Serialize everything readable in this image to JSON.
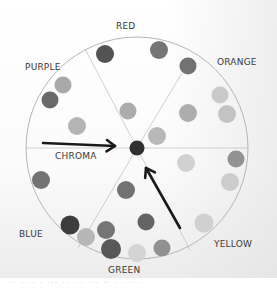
{
  "diagram": {
    "type": "color-wheel",
    "center": {
      "x": 137,
      "y": 148
    },
    "radius": 111,
    "labels": {
      "red": "RED",
      "orange": "ORANGE",
      "yellow": "YELLOW",
      "green": "GREEN",
      "blue": "BLUE",
      "purple": "PURPLE",
      "chroma": "CHROMA"
    },
    "colors": {
      "circle_stroke": "#b5b5b5",
      "divider_stroke": "#c4c4c4",
      "arrow": "#1a1a1a",
      "label_text": "#3a3a3a"
    },
    "dividers": [
      {
        "x2": 26,
        "y2": 148
      },
      {
        "x2": 248,
        "y2": 148
      },
      {
        "x2": 85,
        "y2": 49
      },
      {
        "x2": 182,
        "y2": 73
      },
      {
        "x2": 78,
        "y2": 248
      },
      {
        "x2": 190,
        "y2": 250
      }
    ],
    "dots": [
      {
        "x": 105,
        "y": 54,
        "r": 9,
        "shade": "#4a4a4a"
      },
      {
        "x": 159,
        "y": 50,
        "r": 9,
        "shade": "#6e6e6e"
      },
      {
        "x": 188,
        "y": 66,
        "r": 8.5,
        "shade": "#6a6a6a"
      },
      {
        "x": 63,
        "y": 85,
        "r": 8.5,
        "shade": "#a4a4a4"
      },
      {
        "x": 50,
        "y": 100,
        "r": 8.5,
        "shade": "#626262"
      },
      {
        "x": 128,
        "y": 111,
        "r": 8.5,
        "shade": "#a8a8a8"
      },
      {
        "x": 77,
        "y": 126,
        "r": 9,
        "shade": "#b0b0b0"
      },
      {
        "x": 220,
        "y": 95,
        "r": 8.5,
        "shade": "#c6c6c6"
      },
      {
        "x": 188,
        "y": 113,
        "r": 9,
        "shade": "#a9a9a9"
      },
      {
        "x": 227,
        "y": 114,
        "r": 9,
        "shade": "#c0c0c0"
      },
      {
        "x": 157,
        "y": 136,
        "r": 9,
        "shade": "#b4b4b4"
      },
      {
        "x": 186,
        "y": 163,
        "r": 9,
        "shade": "#cfcfcf"
      },
      {
        "x": 236,
        "y": 159,
        "r": 8.5,
        "shade": "#8c8c8c"
      },
      {
        "x": 41,
        "y": 180,
        "r": 9,
        "shade": "#6c6c6c"
      },
      {
        "x": 126,
        "y": 190,
        "r": 9,
        "shade": "#6a6a6a"
      },
      {
        "x": 230,
        "y": 182,
        "r": 9,
        "shade": "#c9c9c9"
      },
      {
        "x": 70,
        "y": 225,
        "r": 9.5,
        "shade": "#333333"
      },
      {
        "x": 146,
        "y": 222,
        "r": 8.5,
        "shade": "#5c5c5c"
      },
      {
        "x": 204,
        "y": 223,
        "r": 9.5,
        "shade": "#cdcdcd"
      },
      {
        "x": 106,
        "y": 230,
        "r": 9,
        "shade": "#6e6e6e"
      },
      {
        "x": 86,
        "y": 237,
        "r": 9,
        "shade": "#b3b3b3"
      },
      {
        "x": 111,
        "y": 249,
        "r": 10,
        "shade": "#4f4f4f"
      },
      {
        "x": 137,
        "y": 253,
        "r": 9,
        "shade": "#d2d2d2"
      },
      {
        "x": 162,
        "y": 248,
        "r": 8.5,
        "shade": "#8b8b8b"
      },
      {
        "x": 137,
        "y": 148,
        "r": 7.5,
        "shade": "#262626"
      }
    ],
    "arrows": [
      {
        "name": "chroma-arrow-horizontal",
        "x1": 43,
        "y1": 143,
        "x2": 115,
        "y2": 146
      },
      {
        "name": "chroma-arrow-diagonal",
        "x1": 180,
        "y1": 228,
        "x2": 146,
        "y2": 168
      }
    ],
    "caption": "·· ·  ··  ·   ···  ··  ·  ·   ···   ·· ·  ·   ·· ·"
  }
}
